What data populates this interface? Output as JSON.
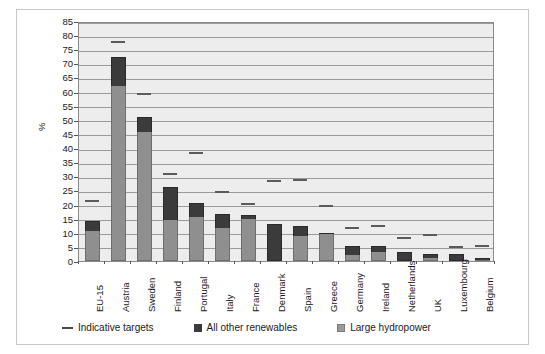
{
  "chart_data": {
    "type": "bar",
    "title": "",
    "subtitle": "",
    "xlabel": "",
    "ylabel": "%",
    "ylim": [
      0,
      85
    ],
    "ytick_step": 5,
    "yticks": [
      0,
      5,
      10,
      15,
      20,
      25,
      30,
      35,
      40,
      45,
      50,
      55,
      60,
      65,
      70,
      75,
      80,
      85
    ],
    "grid": true,
    "stacked": true,
    "legend_position": "bottom",
    "categories": [
      "EU-15",
      "Austria",
      "Sweden",
      "Finland",
      "Portugal",
      "Italy",
      "France",
      "Denmark",
      "Spain",
      "Greece",
      "Germany",
      "Ireland",
      "Netherlands",
      "UK",
      "Luxembourg",
      "Belgium"
    ],
    "series": [
      {
        "name": "Large hydropower",
        "color": "#8f8f8f",
        "values": [
          10.5,
          62.0,
          45.7,
          14.5,
          15.5,
          11.7,
          15.0,
          0.0,
          8.7,
          9.4,
          2.3,
          3.1,
          0.0,
          1.1,
          0.0,
          0.2
        ]
      },
      {
        "name": "All other renewables",
        "color": "#3b3b3b",
        "values": [
          3.5,
          10.2,
          5.3,
          11.8,
          5.0,
          5.1,
          1.3,
          13.1,
          3.8,
          0.4,
          2.9,
          2.1,
          3.2,
          1.4,
          2.5,
          1.0
        ]
      }
    ],
    "overlay": {
      "name": "Indicative targets",
      "marker": "dash",
      "color": "#5b5b5b",
      "values": [
        22.0,
        78.1,
        60.0,
        31.5,
        39.0,
        25.2,
        21.0,
        29.0,
        29.4,
        20.1,
        12.3,
        13.2,
        9.0,
        10.0,
        5.7,
        6.0
      ]
    }
  },
  "legend": {
    "items": [
      {
        "label": "Indicative targets",
        "marker": "dash"
      },
      {
        "label": "All other renewables",
        "marker": "dark-square"
      },
      {
        "label": "Large hydropower",
        "marker": "gray-square"
      }
    ]
  },
  "colors": {
    "plot_background": "#ededed",
    "gridline": "#9a9a9a",
    "axis": "#8a8a8a",
    "hydropower": "#8f8f8f",
    "other_renewables": "#3b3b3b",
    "target": "#5b5b5b",
    "frame": "#c8c8c8"
  }
}
